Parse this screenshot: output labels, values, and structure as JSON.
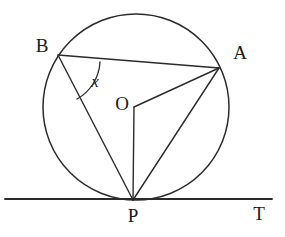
{
  "figure": {
    "type": "geometry-diagram",
    "background_color": "#ffffff",
    "stroke_color": "#2b2b2b",
    "label_color": "#1a1a1a"
  },
  "labels": {
    "b": "B",
    "a": "A",
    "o": "O",
    "p": "P",
    "t": "T",
    "angle_x": "x"
  },
  "geometry": {
    "circle": {
      "cx": 136,
      "cy": 107,
      "r": 93
    },
    "points": {
      "B": {
        "x": 58,
        "y": 55
      },
      "A": {
        "x": 219,
        "y": 68
      },
      "O": {
        "x": 134,
        "y": 107
      },
      "P": {
        "x": 133,
        "y": 200
      }
    },
    "label_positions": {
      "B": {
        "x": 42,
        "y": 52
      },
      "A": {
        "x": 240,
        "y": 59
      },
      "O": {
        "x": 122,
        "y": 110
      },
      "P": {
        "x": 133,
        "y": 222
      },
      "T": {
        "x": 259,
        "y": 220
      },
      "x": {
        "x": 95,
        "y": 87
      }
    },
    "tangent_line": {
      "x1": 5,
      "y1": 199,
      "x2": 272,
      "y2": 199
    },
    "segments": [
      {
        "name": "BA",
        "from": "B",
        "to": "A"
      },
      {
        "name": "BP",
        "from": "B",
        "to": "P"
      },
      {
        "name": "OA",
        "from": "O",
        "to": "A"
      },
      {
        "name": "OP",
        "from": "O",
        "to": "P"
      },
      {
        "name": "AP",
        "from": "A",
        "to": "P"
      }
    ],
    "angle_arc": {
      "at_vertex": "B",
      "between": [
        "BA",
        "BP"
      ],
      "label": "x",
      "path": "M 100 62 A 45 45 0 0 1 77 99"
    }
  }
}
